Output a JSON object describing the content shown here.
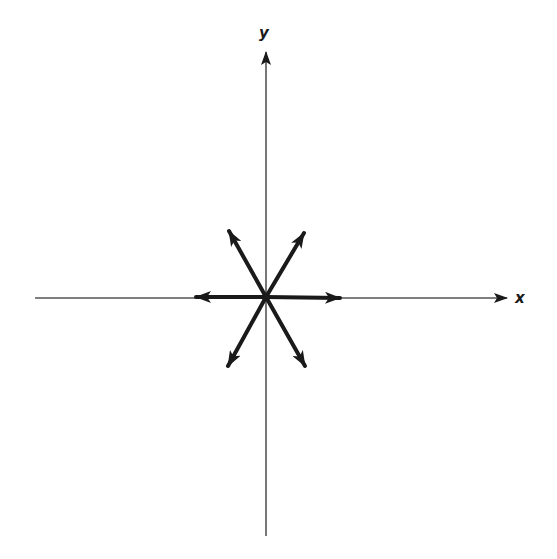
{
  "diagram": {
    "type": "vector-star",
    "axes": {
      "x_label": "x",
      "y_label": "y",
      "origin": [
        266,
        297
      ],
      "x_axis": {
        "from": [
          35,
          298
        ],
        "to": [
          507,
          298
        ]
      },
      "y_axis": {
        "from": [
          266,
          536
        ],
        "to": [
          266,
          52
        ]
      }
    },
    "vectors": [
      {
        "name": "vector-right",
        "angle_deg": 0,
        "tip": [
          340,
          298
        ]
      },
      {
        "name": "vector-upper-right",
        "angle_deg": 60,
        "tip": [
          304,
          233
        ]
      },
      {
        "name": "vector-upper-left",
        "angle_deg": 120,
        "tip": [
          229,
          231
        ]
      },
      {
        "name": "vector-left",
        "angle_deg": 180,
        "tip": [
          196,
          297
        ]
      },
      {
        "name": "vector-lower-left",
        "angle_deg": 240,
        "tip": [
          228,
          366
        ]
      },
      {
        "name": "vector-lower-right",
        "angle_deg": 300,
        "tip": [
          305,
          366
        ]
      }
    ],
    "colors": {
      "axis": "#555555",
      "vector": "#1a1a1a",
      "background": "#ffffff"
    }
  }
}
